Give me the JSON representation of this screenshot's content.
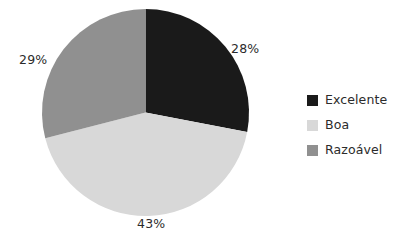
{
  "chart_data": {
    "type": "pie",
    "title": "",
    "categories": [
      "Excelente",
      "Boa",
      "Razoável"
    ],
    "values": [
      28,
      43,
      29
    ],
    "value_labels": [
      "28%",
      "43%",
      "29%"
    ],
    "unit": "%",
    "start_angle_deg": 0,
    "direction": "clockwise",
    "colors": [
      "#1a1a1a",
      "#d8d8d8",
      "#909090"
    ],
    "legend_position": "right",
    "grid": false,
    "background": "#ffffff",
    "label_color": "#2b2b2b"
  },
  "pie": {
    "labels": {
      "excelente": "28%",
      "boa": "43%",
      "razoavel": "29%"
    }
  },
  "legend": {
    "items": [
      {
        "label": "Excelente",
        "color": "#1a1a1a",
        "value": "28%"
      },
      {
        "label": "Boa",
        "color": "#d8d8d8",
        "value": "43%"
      },
      {
        "label": "Razoável",
        "color": "#909090",
        "value": "29%"
      }
    ]
  }
}
